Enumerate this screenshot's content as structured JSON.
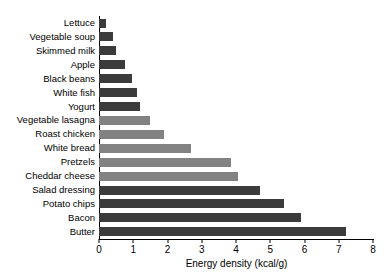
{
  "chart_data": {
    "type": "bar",
    "orientation": "horizontal",
    "title": "",
    "xlabel": "Energy density (kcal/g)",
    "ylabel": "",
    "xlim": [
      0,
      8
    ],
    "xticks": [
      0,
      1,
      2,
      3,
      4,
      5,
      6,
      7,
      8
    ],
    "grid": false,
    "legend": false,
    "categories": [
      "Lettuce",
      "Vegetable soup",
      "Skimmed milk",
      "Apple",
      "Black beans",
      "White fish",
      "Yogurt",
      "Vegetable lasagna",
      "Roast chicken",
      "White bread",
      "Pretzels",
      "Cheddar cheese",
      "Salad dressing",
      "Potato chips",
      "Bacon",
      "Butter"
    ],
    "values": [
      0.2,
      0.4,
      0.5,
      0.75,
      0.95,
      1.1,
      1.2,
      1.5,
      1.9,
      2.7,
      3.85,
      4.05,
      4.7,
      5.4,
      5.9,
      7.2
    ],
    "bar_colors": [
      "#3b3b3b",
      "#3b3b3b",
      "#3b3b3b",
      "#3b3b3b",
      "#3b3b3b",
      "#3b3b3b",
      "#3b3b3b",
      "#828282",
      "#828282",
      "#828282",
      "#828282",
      "#828282",
      "#3b3b3b",
      "#3b3b3b",
      "#3b3b3b",
      "#3b3b3b"
    ],
    "colors": {
      "dark_gray": "#3b3b3b",
      "light_gray": "#828282",
      "axis": "#000000",
      "background": "#ffffff"
    }
  }
}
